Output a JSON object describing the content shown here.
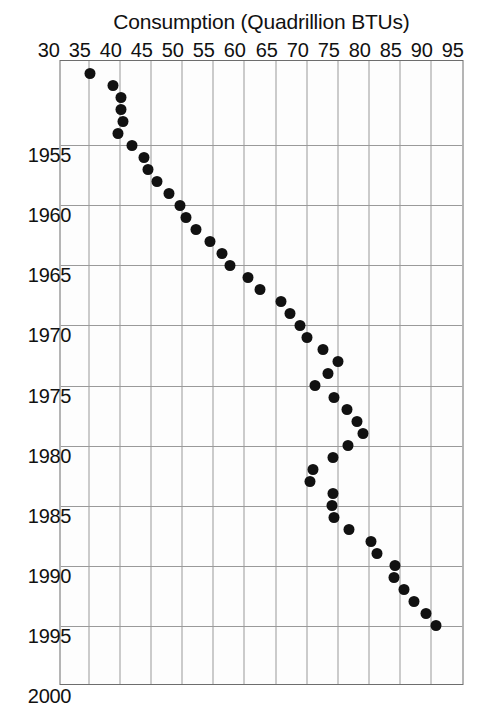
{
  "chart_data": {
    "type": "scatter",
    "title": "Total Energy Consumption in the U.S.",
    "xlabel": "",
    "ylabel": "Consumption (Quadrillion BTUs)",
    "xlim": [
      1948,
      2000
    ],
    "ylim": [
      30,
      95
    ],
    "grid": true,
    "legend": null,
    "marker": "filled-circle",
    "marker_color": "#111111",
    "orientation": "rotated-90-clockwise",
    "x_tick_labels": [
      "1955",
      "1960",
      "1965",
      "1970",
      "1975",
      "1980",
      "1985",
      "1990",
      "1995",
      "2000"
    ],
    "x_ticks": [
      1955,
      1960,
      1965,
      1970,
      1975,
      1980,
      1985,
      1990,
      1995,
      2000
    ],
    "y_tick_labels": [
      "30",
      "35",
      "40",
      "45",
      "50",
      "55",
      "60",
      "65",
      "70",
      "75",
      "80",
      "85",
      "90",
      "95"
    ],
    "y_ticks": [
      30,
      35,
      40,
      45,
      50,
      55,
      60,
      65,
      70,
      75,
      80,
      85,
      90,
      95
    ],
    "x": [
      1949,
      1950,
      1951,
      1952,
      1953,
      1954,
      1955,
      1956,
      1957,
      1958,
      1959,
      1960,
      1961,
      1962,
      1963,
      1964,
      1965,
      1966,
      1967,
      1968,
      1969,
      1970,
      1971,
      1972,
      1973,
      1974,
      1975,
      1976,
      1977,
      1978,
      1979,
      1980,
      1981,
      1982,
      1983,
      1984,
      1985,
      1986,
      1987,
      1988,
      1989,
      1990,
      1991,
      1992,
      1993,
      1994,
      1995
    ],
    "y": [
      35.0,
      38.8,
      40.0,
      40.0,
      40.3,
      39.6,
      41.8,
      43.8,
      44.4,
      45.8,
      47.8,
      49.5,
      50.5,
      52.2,
      54.3,
      56.3,
      57.6,
      60.5,
      62.4,
      65.8,
      67.3,
      68.8,
      70.0,
      72.6,
      75.0,
      73.4,
      71.2,
      74.4,
      76.4,
      78.1,
      79.0,
      76.5,
      74.1,
      71.0,
      70.5,
      74.1,
      74.0,
      74.3,
      76.8,
      80.2,
      81.3,
      84.1,
      84.0,
      85.6,
      87.2,
      89.2,
      90.8
    ],
    "points": [
      {
        "year": 1949,
        "value": 35.0
      },
      {
        "year": 1950,
        "value": 38.8
      },
      {
        "year": 1951,
        "value": 40.0
      },
      {
        "year": 1952,
        "value": 40.0
      },
      {
        "year": 1953,
        "value": 40.3
      },
      {
        "year": 1954,
        "value": 39.6
      },
      {
        "year": 1955,
        "value": 41.8
      },
      {
        "year": 1956,
        "value": 43.8
      },
      {
        "year": 1957,
        "value": 44.4
      },
      {
        "year": 1958,
        "value": 45.8
      },
      {
        "year": 1959,
        "value": 47.8
      },
      {
        "year": 1960,
        "value": 49.5
      },
      {
        "year": 1961,
        "value": 50.5
      },
      {
        "year": 1962,
        "value": 52.2
      },
      {
        "year": 1963,
        "value": 54.3
      },
      {
        "year": 1964,
        "value": 56.3
      },
      {
        "year": 1965,
        "value": 57.6
      },
      {
        "year": 1966,
        "value": 60.5
      },
      {
        "year": 1967,
        "value": 62.4
      },
      {
        "year": 1968,
        "value": 65.8
      },
      {
        "year": 1969,
        "value": 67.3
      },
      {
        "year": 1970,
        "value": 68.8
      },
      {
        "year": 1971,
        "value": 70.0
      },
      {
        "year": 1972,
        "value": 72.6
      },
      {
        "year": 1973,
        "value": 75.0
      },
      {
        "year": 1974,
        "value": 73.4
      },
      {
        "year": 1975,
        "value": 71.2
      },
      {
        "year": 1976,
        "value": 74.4
      },
      {
        "year": 1977,
        "value": 76.4
      },
      {
        "year": 1978,
        "value": 78.1
      },
      {
        "year": 1979,
        "value": 79.0
      },
      {
        "year": 1980,
        "value": 76.5
      },
      {
        "year": 1981,
        "value": 74.1
      },
      {
        "year": 1982,
        "value": 71.0
      },
      {
        "year": 1983,
        "value": 70.5
      },
      {
        "year": 1984,
        "value": 74.1
      },
      {
        "year": 1985,
        "value": 74.0
      },
      {
        "year": 1986,
        "value": 74.3
      },
      {
        "year": 1987,
        "value": 76.8
      },
      {
        "year": 1988,
        "value": 80.2
      },
      {
        "year": 1989,
        "value": 81.3
      },
      {
        "year": 1990,
        "value": 84.1
      },
      {
        "year": 1991,
        "value": 84.0
      },
      {
        "year": 1992,
        "value": 85.6
      },
      {
        "year": 1993,
        "value": 87.2
      },
      {
        "year": 1994,
        "value": 89.2
      },
      {
        "year": 1995,
        "value": 90.8
      }
    ]
  }
}
